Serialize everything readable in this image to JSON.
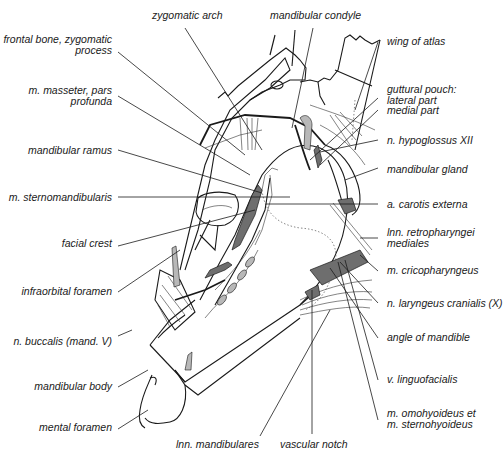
{
  "figure": {
    "colors": {
      "ink": "#1a1a1a",
      "muscle_fill": "#6e6e6e",
      "light_fill": "#b8b8b8",
      "background": "#ffffff"
    }
  },
  "labels": {
    "left": [
      {
        "id": "frontal-bone",
        "lines": [
          "frontal bone, zygomatic",
          "process"
        ]
      },
      {
        "id": "masseter",
        "lines": [
          "m. masseter, pars",
          "profunda"
        ]
      },
      {
        "id": "mandibular-ramus",
        "lines": [
          "mandibular ramus"
        ]
      },
      {
        "id": "sternomandibularis",
        "lines": [
          "m. sternomandibularis"
        ]
      },
      {
        "id": "facial-crest",
        "lines": [
          "facial crest"
        ]
      },
      {
        "id": "infraorbital-foramen",
        "lines": [
          "infraorbital foramen"
        ]
      },
      {
        "id": "n-buccalis",
        "lines": [
          "n. buccalis (mand. V)"
        ]
      },
      {
        "id": "mandibular-body",
        "lines": [
          "mandibular body"
        ]
      },
      {
        "id": "mental-foramen",
        "lines": [
          "mental foramen"
        ]
      }
    ],
    "top": [
      {
        "id": "zygomatic-arch",
        "lines": [
          "zygomatic arch"
        ]
      },
      {
        "id": "mandibular-condyle",
        "lines": [
          "mandibular condyle"
        ]
      }
    ],
    "right": [
      {
        "id": "wing-of-atlas",
        "lines": [
          "wing of atlas"
        ]
      },
      {
        "id": "guttural-pouch",
        "lines": [
          "guttural pouch:",
          "lateral part",
          "medial part"
        ]
      },
      {
        "id": "n-hypoglossus",
        "lines": [
          "n. hypoglossus XII"
        ]
      },
      {
        "id": "mandibular-gland",
        "lines": [
          "mandibular gland"
        ]
      },
      {
        "id": "a-carotis-externa",
        "lines": [
          "a. carotis externa"
        ]
      },
      {
        "id": "lnn-retropharyngei",
        "lines": [
          "lnn. retropharyngei",
          "mediales"
        ]
      },
      {
        "id": "m-cricopharyngeus",
        "lines": [
          "m. cricopharyngeus"
        ]
      },
      {
        "id": "n-laryngeus",
        "lines": [
          "n. laryngeus cranialis (X)"
        ]
      },
      {
        "id": "angle-of-mandible",
        "lines": [
          "angle of mandible"
        ]
      },
      {
        "id": "v-linguofacialis",
        "lines": [
          "v. linguofacialis"
        ]
      },
      {
        "id": "m-omohyoideus",
        "lines": [
          "m. omohyoideus et",
          "m. sternohyoideus"
        ]
      }
    ],
    "bottom": [
      {
        "id": "lnn-mandibulares",
        "lines": [
          "lnn. mandibulares"
        ]
      },
      {
        "id": "vascular-notch",
        "lines": [
          "vascular notch"
        ]
      }
    ]
  }
}
